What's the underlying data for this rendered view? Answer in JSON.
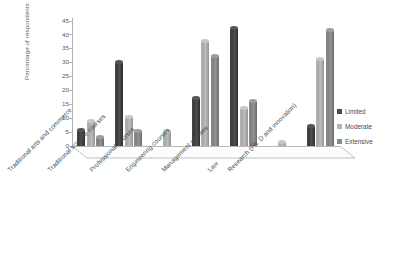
{
  "chart_data": {
    "type": "bar",
    "title": "",
    "xlabel": "",
    "ylabel": "Percentage of respondents",
    "ylim": [
      0,
      45
    ],
    "yticks": [
      0,
      5,
      10,
      15,
      20,
      25,
      30,
      35,
      40,
      45
    ],
    "grid": false,
    "legend_position": "right",
    "categories": [
      "Traditional arts and commerce",
      "Traditional science courses",
      "Professional courses",
      "Engineering courses",
      "Management courses",
      "Law",
      "Research (Ph. D and innovation)"
    ],
    "series": [
      {
        "name": "Limited",
        "color": "#4a4a4a",
        "values": [
          5.5,
          30,
          0,
          17,
          42,
          0,
          7
        ]
      },
      {
        "name": "Moderate",
        "color": "#b3b3b3",
        "values": [
          8.5,
          10,
          5,
          37.5,
          13.5,
          1,
          31
        ]
      },
      {
        "name": "Extensive",
        "color": "#8a8a8a",
        "values": [
          3,
          5,
          0,
          32,
          16,
          0,
          41.5
        ]
      }
    ]
  },
  "legend": {
    "items": [
      {
        "label": "Limited"
      },
      {
        "label": "Moderate"
      },
      {
        "label": "Extensive"
      }
    ]
  },
  "axis": {
    "y_title": "Percentage of respondents"
  }
}
